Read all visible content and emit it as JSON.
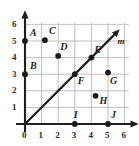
{
  "chart_data": {
    "type": "scatter",
    "title": "",
    "xlabel": "",
    "ylabel": "",
    "xlim": [
      0,
      6
    ],
    "ylim": [
      0,
      6
    ],
    "xticks": [
      "0",
      "1",
      "2",
      "3",
      "4",
      "5",
      "6"
    ],
    "yticks": [
      "0",
      "1",
      "2",
      "3",
      "4",
      "5",
      "6"
    ],
    "grid": true,
    "legend": "none",
    "points": [
      {
        "label": "A",
        "x": 0,
        "y": 5
      },
      {
        "label": "B",
        "x": 0,
        "y": 3
      },
      {
        "label": "C",
        "x": 1.2,
        "y": 5.05
      },
      {
        "label": "D",
        "x": 2,
        "y": 4.1
      },
      {
        "label": "E",
        "x": 4,
        "y": 4
      },
      {
        "label": "F",
        "x": 3,
        "y": 3
      },
      {
        "label": "G",
        "x": 5,
        "y": 3.1
      },
      {
        "label": "H",
        "x": 4.25,
        "y": 1.7
      },
      {
        "label": "I",
        "x": 3,
        "y": 0
      },
      {
        "label": "J",
        "x": 5,
        "y": 0
      }
    ],
    "lines": [
      {
        "label": "m",
        "equation": "y = x",
        "from": {
          "x": 0,
          "y": 0
        },
        "to": {
          "x": 5.7,
          "y": 5.7
        },
        "arrow": "end"
      }
    ],
    "axes": {
      "x_arrow": true,
      "y_arrow": true,
      "origin_label": "0"
    },
    "colors": {
      "grid": "#b9b9b9",
      "axis": "#1f1f1f",
      "point": "#1a1a1a",
      "line": "#1f1f1f",
      "background": "#ffffff",
      "label": "#1f1f1f"
    }
  },
  "point_label_offsets": [
    {
      "label": "A",
      "dx": 5,
      "dy": -13
    },
    {
      "label": "B",
      "dx": 5,
      "dy": -13
    },
    {
      "label": "C",
      "dx": 4,
      "dy": -14
    },
    {
      "label": "D",
      "dx": 2,
      "dy": -14
    },
    {
      "label": "E",
      "dx": 3,
      "dy": -13
    },
    {
      "label": "F",
      "dx": 3,
      "dy": 2
    },
    {
      "label": "G",
      "dx": 2,
      "dy": 3
    },
    {
      "label": "H",
      "dx": 4,
      "dy": 0
    },
    {
      "label": "I",
      "dx": -1,
      "dy": -14
    },
    {
      "label": "J",
      "dx": 3,
      "dy": -14
    }
  ],
  "line_label_offset": {
    "dx": 2,
    "dy": 8
  }
}
